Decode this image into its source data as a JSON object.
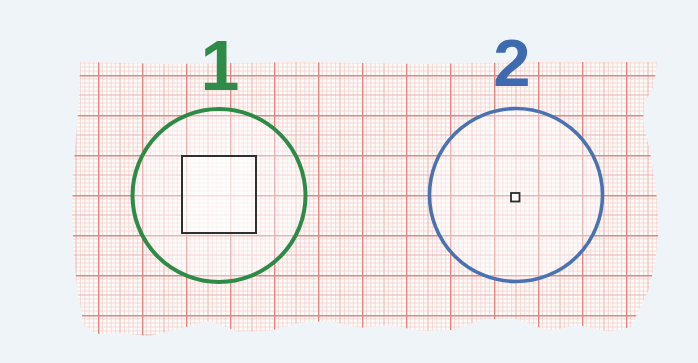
{
  "scene": {
    "description": "Scanned piece of red-grid graph paper with two drawn circles labeled 1 and 2",
    "page_background": "#eff4f8",
    "paper_color": "#fcfbf7"
  },
  "grid": {
    "fine_color": "#f3cccc",
    "medium_color": "#eaabab",
    "major_color": "#e18585"
  },
  "figures": [
    {
      "label": "1",
      "label_color": "#2f8c48",
      "circle_color": "#2e8b47",
      "inner_shape": "large centered square",
      "inner_shape_color": "#2f2f2f"
    },
    {
      "label": "2",
      "label_color": "#3e6ab0",
      "circle_color": "#4a72b2",
      "inner_shape": "tiny centered square",
      "inner_shape_color": "#2b2b2b"
    }
  ]
}
